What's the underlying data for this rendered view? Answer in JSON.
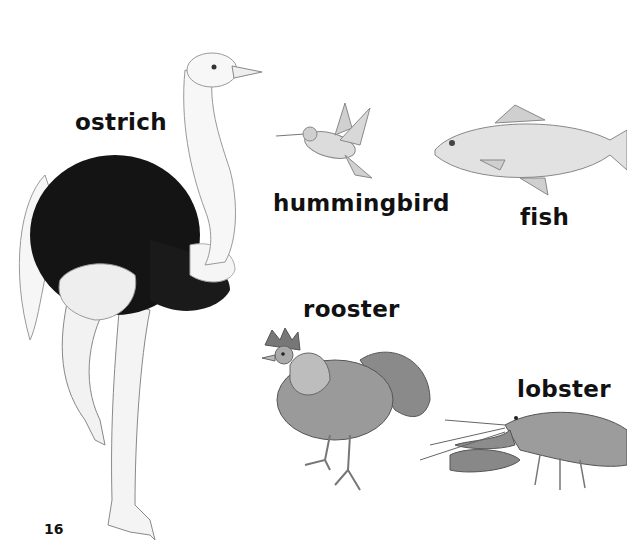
{
  "page": {
    "page_number": "16",
    "labels": {
      "ostrich": "ostrich",
      "hummingbird": "hummingbird",
      "fish": "fish",
      "rooster": "rooster",
      "lobster": "lobster"
    },
    "illustrations": [
      "ostrich",
      "hummingbird",
      "fish",
      "rooster",
      "lobster"
    ]
  }
}
